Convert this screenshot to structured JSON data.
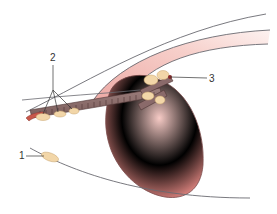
{
  "diagram": {
    "type": "anatomical-illustration",
    "labels": [
      {
        "id": "1",
        "text": "1",
        "target": "small oval node on lower outer contour line"
      },
      {
        "id": "2",
        "text": "2",
        "target": "chain of small nodes along the duct/vessel on the left"
      },
      {
        "id": "3",
        "text": "3",
        "target": "cluster of nodes at hilum of large ovoid organ"
      }
    ],
    "colors": {
      "organ_fill": "#eb9a96",
      "organ_highlight": "#f6c6c2",
      "organ_outline": "#7a4a4a",
      "band_fill": "#f1b3ad",
      "duct_fill": "#8a6a6a",
      "duct_outline": "#4e3434",
      "node_fill": "#f2d6a8",
      "node_outline": "#c9a46e",
      "vessel_red": "#c8574a",
      "contour_line": "#6a6a70",
      "leader_line": "#333333"
    }
  }
}
